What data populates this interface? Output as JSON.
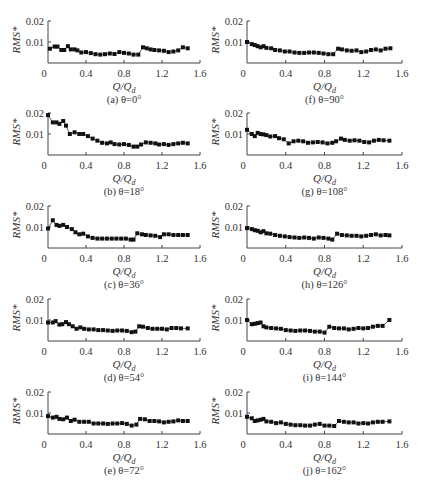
{
  "figure": {
    "xlabel": "Q/Q_d",
    "ylabel": "RMS*",
    "x_ticks": [
      "0",
      "0.4",
      "0.8",
      "1.2",
      "1.6"
    ],
    "y_ticks": [
      "0.01",
      "0.02"
    ]
  },
  "chart_data": [
    {
      "type": "line",
      "panel": "a",
      "caption": "(a) θ=0°",
      "title": "(a) θ=0°",
      "xlabel": "Q/Qd",
      "ylabel": "RMS*",
      "xlim": [
        0,
        1.6
      ],
      "ylim": [
        0,
        0.02
      ],
      "x": [
        0.02,
        0.07,
        0.1,
        0.14,
        0.17,
        0.21,
        0.24,
        0.28,
        0.31,
        0.35,
        0.4,
        0.45,
        0.5,
        0.55,
        0.6,
        0.65,
        0.7,
        0.75,
        0.8,
        0.85,
        0.9,
        0.95,
        1.0,
        1.04,
        1.08,
        1.12,
        1.17,
        1.22,
        1.27,
        1.32,
        1.37,
        1.42,
        1.47
      ],
      "values": [
        0.0068,
        0.0078,
        0.0078,
        0.0062,
        0.0062,
        0.008,
        0.0065,
        0.0065,
        0.006,
        0.005,
        0.0052,
        0.0047,
        0.0042,
        0.004,
        0.0042,
        0.0045,
        0.0043,
        0.0052,
        0.0048,
        0.0045,
        0.004,
        0.004,
        0.0075,
        0.007,
        0.0065,
        0.0062,
        0.006,
        0.0058,
        0.0052,
        0.0055,
        0.006,
        0.0075,
        0.007
      ]
    },
    {
      "type": "line",
      "panel": "b",
      "caption": "(b) θ=18°",
      "title": "(b) θ=18°",
      "xlabel": "Q/Qd",
      "ylabel": "RMS*",
      "xlim": [
        0,
        1.6
      ],
      "ylim": [
        0,
        0.02
      ],
      "x": [
        0.0,
        0.05,
        0.09,
        0.12,
        0.16,
        0.19,
        0.23,
        0.28,
        0.33,
        0.37,
        0.42,
        0.47,
        0.52,
        0.57,
        0.62,
        0.66,
        0.7,
        0.75,
        0.8,
        0.85,
        0.9,
        0.94,
        0.98,
        1.03,
        1.08,
        1.13,
        1.17,
        1.22,
        1.27,
        1.32,
        1.37,
        1.42,
        1.47
      ],
      "values": [
        0.019,
        0.0155,
        0.0155,
        0.0148,
        0.0162,
        0.014,
        0.01,
        0.0108,
        0.01,
        0.01,
        0.009,
        0.0078,
        0.0068,
        0.0058,
        0.0055,
        0.006,
        0.0052,
        0.005,
        0.0052,
        0.0048,
        0.004,
        0.004,
        0.005,
        0.006,
        0.0058,
        0.0055,
        0.005,
        0.0052,
        0.0048,
        0.0052,
        0.0055,
        0.0058,
        0.0055
      ]
    },
    {
      "type": "line",
      "panel": "c",
      "caption": "(c) θ=36°",
      "title": "(c) θ=36°",
      "xlabel": "Q/Qd",
      "ylabel": "RMS*",
      "xlim": [
        0,
        1.6
      ],
      "ylim": [
        0,
        0.02
      ],
      "x": [
        0.0,
        0.05,
        0.09,
        0.12,
        0.16,
        0.2,
        0.25,
        0.29,
        0.33,
        0.37,
        0.42,
        0.47,
        0.52,
        0.57,
        0.62,
        0.67,
        0.72,
        0.77,
        0.82,
        0.87,
        0.9,
        0.94,
        0.99,
        1.03,
        1.08,
        1.13,
        1.18,
        1.22,
        1.27,
        1.32,
        1.37,
        1.42,
        1.47
      ],
      "values": [
        0.0093,
        0.0132,
        0.011,
        0.0105,
        0.011,
        0.01,
        0.009,
        0.0075,
        0.0065,
        0.0068,
        0.0055,
        0.0048,
        0.0045,
        0.0045,
        0.0045,
        0.0045,
        0.0045,
        0.0045,
        0.0045,
        0.004,
        0.004,
        0.007,
        0.0065,
        0.0062,
        0.006,
        0.0058,
        0.0052,
        0.0065,
        0.0065,
        0.0062,
        0.0062,
        0.0062,
        0.0062
      ]
    },
    {
      "type": "line",
      "panel": "d",
      "caption": "(d) θ=54°",
      "title": "(d) θ=54°",
      "xlabel": "Q/Qd",
      "ylabel": "RMS*",
      "xlim": [
        0,
        1.6
      ],
      "ylim": [
        0,
        0.02
      ],
      "x": [
        0.0,
        0.05,
        0.08,
        0.12,
        0.15,
        0.19,
        0.22,
        0.26,
        0.3,
        0.34,
        0.38,
        0.43,
        0.48,
        0.53,
        0.58,
        0.63,
        0.68,
        0.73,
        0.78,
        0.83,
        0.88,
        0.92,
        0.96,
        1.0,
        1.05,
        1.1,
        1.15,
        1.2,
        1.25,
        1.3,
        1.35,
        1.4,
        1.47
      ],
      "values": [
        0.0088,
        0.0088,
        0.0095,
        0.0078,
        0.008,
        0.009,
        0.008,
        0.007,
        0.0058,
        0.0065,
        0.0058,
        0.0055,
        0.0055,
        0.0052,
        0.0052,
        0.005,
        0.0048,
        0.005,
        0.005,
        0.0048,
        0.0042,
        0.0045,
        0.007,
        0.0068,
        0.0062,
        0.0058,
        0.0058,
        0.0058,
        0.0055,
        0.0062,
        0.0062,
        0.006,
        0.006
      ]
    },
    {
      "type": "line",
      "panel": "e",
      "caption": "(e) θ=72°",
      "title": "(e) θ=72°",
      "xlabel": "Q/Qd",
      "ylabel": "RMS*",
      "xlim": [
        0,
        1.6
      ],
      "ylim": [
        0,
        0.02
      ],
      "x": [
        0.0,
        0.05,
        0.09,
        0.12,
        0.16,
        0.2,
        0.24,
        0.28,
        0.33,
        0.38,
        0.43,
        0.48,
        0.53,
        0.58,
        0.63,
        0.68,
        0.73,
        0.78,
        0.83,
        0.88,
        0.93,
        0.97,
        1.02,
        1.07,
        1.12,
        1.17,
        1.22,
        1.27,
        1.32,
        1.37,
        1.42,
        1.47
      ],
      "values": [
        0.0085,
        0.0078,
        0.0082,
        0.0072,
        0.007,
        0.0078,
        0.0062,
        0.0068,
        0.0058,
        0.0058,
        0.0058,
        0.005,
        0.005,
        0.005,
        0.0048,
        0.005,
        0.005,
        0.0052,
        0.0048,
        0.004,
        0.0045,
        0.0072,
        0.007,
        0.0062,
        0.0062,
        0.006,
        0.0055,
        0.0058,
        0.006,
        0.0065,
        0.0062,
        0.0062
      ]
    },
    {
      "type": "line",
      "panel": "f",
      "caption": "(f) θ=90°",
      "title": "(f) θ=90°",
      "xlabel": "Q/Qd",
      "ylabel": "RMS*",
      "xlim": [
        0,
        1.6
      ],
      "ylim": [
        0,
        0.02
      ],
      "x": [
        0.0,
        0.05,
        0.08,
        0.11,
        0.14,
        0.17,
        0.2,
        0.25,
        0.29,
        0.34,
        0.39,
        0.44,
        0.49,
        0.54,
        0.59,
        0.64,
        0.69,
        0.74,
        0.79,
        0.84,
        0.89,
        0.94,
        0.98,
        1.03,
        1.08,
        1.13,
        1.18,
        1.23,
        1.28,
        1.33,
        1.38,
        1.43,
        1.48
      ],
      "values": [
        0.01,
        0.009,
        0.0085,
        0.008,
        0.0075,
        0.008,
        0.0072,
        0.007,
        0.0062,
        0.006,
        0.0055,
        0.0055,
        0.005,
        0.0048,
        0.0048,
        0.005,
        0.005,
        0.0048,
        0.0045,
        0.0042,
        0.0042,
        0.0068,
        0.0065,
        0.006,
        0.0058,
        0.006,
        0.0052,
        0.0055,
        0.0062,
        0.0065,
        0.006,
        0.0068,
        0.007
      ]
    },
    {
      "type": "line",
      "panel": "g",
      "caption": "(g) θ=108°",
      "title": "(g) θ=108°",
      "xlabel": "Q/Qd",
      "ylabel": "RMS*",
      "xlim": [
        0,
        1.6
      ],
      "ylim": [
        0,
        0.02
      ],
      "x": [
        0.0,
        0.05,
        0.08,
        0.11,
        0.14,
        0.17,
        0.2,
        0.24,
        0.29,
        0.33,
        0.38,
        0.43,
        0.48,
        0.53,
        0.58,
        0.63,
        0.68,
        0.73,
        0.78,
        0.83,
        0.88,
        0.92,
        0.97,
        1.01,
        1.06,
        1.11,
        1.16,
        1.21,
        1.26,
        1.31,
        1.36,
        1.41,
        1.47
      ],
      "values": [
        0.012,
        0.01,
        0.009,
        0.0105,
        0.01,
        0.0098,
        0.0095,
        0.0088,
        0.009,
        0.008,
        0.0075,
        0.0055,
        0.0065,
        0.0068,
        0.0065,
        0.0058,
        0.006,
        0.0062,
        0.006,
        0.0055,
        0.0058,
        0.0065,
        0.0078,
        0.0072,
        0.0068,
        0.007,
        0.0068,
        0.0062,
        0.006,
        0.0068,
        0.0072,
        0.007,
        0.0068
      ]
    },
    {
      "type": "line",
      "panel": "h",
      "caption": "(h) θ=126°",
      "title": "(h) θ=126°",
      "xlabel": "Q/Qd",
      "ylabel": "RMS*",
      "xlim": [
        0,
        1.6
      ],
      "ylim": [
        0,
        0.02
      ],
      "x": [
        0.0,
        0.05,
        0.08,
        0.11,
        0.14,
        0.17,
        0.2,
        0.24,
        0.29,
        0.34,
        0.39,
        0.44,
        0.49,
        0.54,
        0.59,
        0.64,
        0.69,
        0.74,
        0.79,
        0.84,
        0.88,
        0.93,
        0.98,
        1.03,
        1.08,
        1.13,
        1.18,
        1.23,
        1.28,
        1.33,
        1.38,
        1.43,
        1.47
      ],
      "values": [
        0.0095,
        0.009,
        0.0085,
        0.0082,
        0.0075,
        0.008,
        0.007,
        0.0068,
        0.0062,
        0.0058,
        0.0055,
        0.0052,
        0.005,
        0.0048,
        0.005,
        0.0048,
        0.0045,
        0.005,
        0.0048,
        0.0045,
        0.004,
        0.0068,
        0.0062,
        0.006,
        0.0058,
        0.0058,
        0.0055,
        0.0058,
        0.0062,
        0.0065,
        0.006,
        0.0062,
        0.006
      ]
    },
    {
      "type": "line",
      "panel": "i",
      "caption": "(i) θ=144°",
      "title": "(i) θ=144°",
      "xlabel": "Q/Qd",
      "ylabel": "RMS*",
      "xlim": [
        0,
        1.6
      ],
      "ylim": [
        0,
        0.02
      ],
      "x": [
        0.0,
        0.05,
        0.08,
        0.11,
        0.14,
        0.17,
        0.2,
        0.25,
        0.3,
        0.35,
        0.4,
        0.45,
        0.5,
        0.55,
        0.6,
        0.65,
        0.7,
        0.75,
        0.8,
        0.85,
        0.9,
        0.95,
        1.0,
        1.05,
        1.1,
        1.15,
        1.2,
        1.25,
        1.3,
        1.35,
        1.4,
        1.47
      ],
      "values": [
        0.01,
        0.008,
        0.0082,
        0.0085,
        0.0088,
        0.007,
        0.0065,
        0.0062,
        0.006,
        0.0058,
        0.0052,
        0.005,
        0.0048,
        0.005,
        0.005,
        0.0048,
        0.0045,
        0.0045,
        0.004,
        0.0068,
        0.0062,
        0.006,
        0.006,
        0.0055,
        0.0058,
        0.0062,
        0.006,
        0.0062,
        0.0068,
        0.0072,
        0.0072,
        0.01
      ]
    },
    {
      "type": "line",
      "panel": "j",
      "caption": "(j) θ=162°",
      "title": "(j) θ=162°",
      "xlabel": "Q/Qd",
      "ylabel": "RMS*",
      "xlim": [
        0,
        1.6
      ],
      "ylim": [
        0,
        0.02
      ],
      "x": [
        0.0,
        0.05,
        0.08,
        0.11,
        0.14,
        0.17,
        0.2,
        0.25,
        0.3,
        0.35,
        0.4,
        0.45,
        0.5,
        0.55,
        0.6,
        0.65,
        0.7,
        0.75,
        0.8,
        0.85,
        0.9,
        0.95,
        1.0,
        1.05,
        1.1,
        1.15,
        1.2,
        1.25,
        1.3,
        1.35,
        1.4,
        1.47
      ],
      "values": [
        0.0082,
        0.0075,
        0.0062,
        0.0065,
        0.0068,
        0.0072,
        0.006,
        0.0058,
        0.0052,
        0.0055,
        0.0048,
        0.0045,
        0.0042,
        0.0042,
        0.004,
        0.004,
        0.0045,
        0.0048,
        0.004,
        0.004,
        0.0038,
        0.0062,
        0.0058,
        0.0055,
        0.0055,
        0.005,
        0.0052,
        0.005,
        0.0055,
        0.0058,
        0.0058,
        0.006
      ]
    }
  ]
}
